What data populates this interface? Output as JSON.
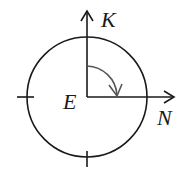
{
  "diagram": {
    "labels": {
      "vertical_axis": "K",
      "horizontal_axis": "N",
      "center": "E"
    },
    "colors": {
      "stroke": "#1a1a1a",
      "arc": "#555555",
      "background": "#ffffff"
    },
    "geometry": {
      "center": [
        87,
        97
      ],
      "circle_radius": 60,
      "arc_radius": 31
    }
  }
}
